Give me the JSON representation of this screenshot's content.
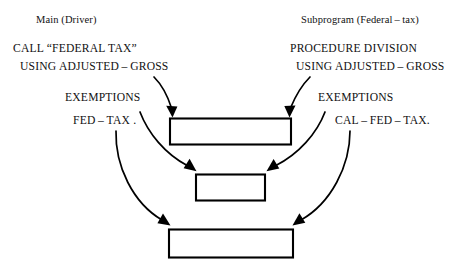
{
  "diagram": {
    "title_left": "Main (Driver)",
    "title_right": "Subprogram (Federal – tax)",
    "left_code": [
      "CALL “FEDERAL TAX”",
      "USING ADJUSTED – GROSS",
      "EXEMPTIONS",
      "FED – TAX ."
    ],
    "right_code": [
      "PROCEDURE DIVISION",
      "USING ADJUSTED – GROSS",
      "EXEMPTIONS",
      "CAL – FED – TAX."
    ],
    "boxes": [
      {
        "name": "adjusted-gross-box",
        "label": "",
        "x": 170,
        "y": 118,
        "w": 121,
        "h": 26
      },
      {
        "name": "exemptions-box",
        "label": "",
        "x": 196,
        "y": 174,
        "w": 69,
        "h": 26
      },
      {
        "name": "fed-tax-box",
        "label": "",
        "x": 169,
        "y": 229,
        "w": 124,
        "h": 28
      }
    ],
    "connector_count": 6,
    "stroke_color": "#000000",
    "background_color": "#ffffff"
  }
}
